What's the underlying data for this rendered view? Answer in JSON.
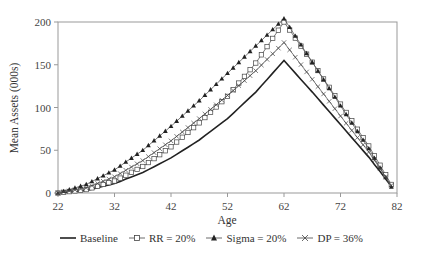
{
  "chart_data": {
    "type": "line",
    "title": "",
    "xlabel": "Age",
    "ylabel": "Mean Assets (000s)",
    "xlim": [
      22,
      82
    ],
    "ylim": [
      0,
      200
    ],
    "x_ticks": [
      "22",
      "32",
      "42",
      "52",
      "62",
      "72",
      "82"
    ],
    "y_ticks": [
      "0",
      "50",
      "100",
      "150",
      "200"
    ],
    "grid": false,
    "legend_position": "bottom",
    "x": [
      22,
      27,
      32,
      37,
      42,
      47,
      52,
      57,
      62,
      67,
      72,
      77,
      81
    ],
    "series": [
      {
        "name": "Baseline",
        "marker": "none",
        "values": [
          0,
          3,
          11,
          24,
          41,
          62,
          87,
          118,
          155,
          118,
          80,
          42,
          8
        ]
      },
      {
        "name": "RR = 20%",
        "marker": "open-square",
        "values": [
          0,
          4,
          14,
          31,
          54,
          82,
          113,
          152,
          200,
          153,
          104,
          55,
          10
        ]
      },
      {
        "name": "Sigma = 20%",
        "marker": "filled-triangle",
        "values": [
          0,
          10,
          27,
          50,
          78,
          108,
          140,
          172,
          204,
          153,
          102,
          52,
          7
        ]
      },
      {
        "name": "DP = 36%",
        "marker": "cross",
        "values": [
          0,
          6,
          19,
          38,
          61,
          87,
          114,
          143,
          176,
          133,
          90,
          48,
          9
        ]
      }
    ]
  },
  "legend": {
    "items": [
      "Baseline",
      "RR = 20%",
      "Sigma = 20%",
      "DP = 36%"
    ]
  },
  "axes": {
    "xlabel": "Age",
    "ylabel": "Mean Assets (000s)"
  }
}
